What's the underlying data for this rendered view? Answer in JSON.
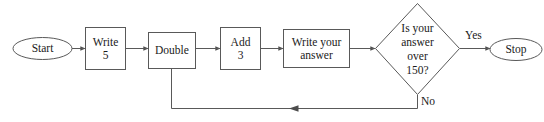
{
  "diagram": {
    "type": "flowchart",
    "title": "",
    "background_color": "#ffffff",
    "stroke_color": "#595959",
    "text_color": "#1a1a1a",
    "nodes": [
      {
        "id": "start",
        "shape": "ellipse",
        "label": "Start",
        "lines": [
          "Start"
        ]
      },
      {
        "id": "write5",
        "shape": "rectangle",
        "label": "Write 5",
        "lines": [
          "Write",
          "5"
        ]
      },
      {
        "id": "double",
        "shape": "rectangle",
        "label": "Double",
        "lines": [
          "Double"
        ]
      },
      {
        "id": "add3",
        "shape": "rectangle",
        "label": "Add 3",
        "lines": [
          "Add",
          "3"
        ]
      },
      {
        "id": "writeanswer",
        "shape": "rectangle",
        "label": "Write your answer",
        "lines": [
          "Write your",
          "answer"
        ]
      },
      {
        "id": "decision",
        "shape": "diamond",
        "label": "Is your answer over 150?",
        "lines": [
          "Is your",
          "answer",
          "over",
          "150?"
        ]
      },
      {
        "id": "stop",
        "shape": "ellipse",
        "label": "Stop",
        "lines": [
          "Stop"
        ]
      }
    ],
    "edges": [
      {
        "id": "e1",
        "from": "start",
        "to": "write5",
        "label": ""
      },
      {
        "id": "e2",
        "from": "write5",
        "to": "double",
        "label": ""
      },
      {
        "id": "e3",
        "from": "double",
        "to": "add3",
        "label": ""
      },
      {
        "id": "e4",
        "from": "add3",
        "to": "writeanswer",
        "label": ""
      },
      {
        "id": "e5",
        "from": "writeanswer",
        "to": "decision",
        "label": ""
      },
      {
        "id": "e6",
        "from": "decision",
        "to": "stop",
        "label": "Yes"
      },
      {
        "id": "e7",
        "from": "decision",
        "to": "double",
        "label": "No"
      }
    ],
    "edge_labels": {
      "yes": "Yes",
      "no": "No"
    }
  }
}
